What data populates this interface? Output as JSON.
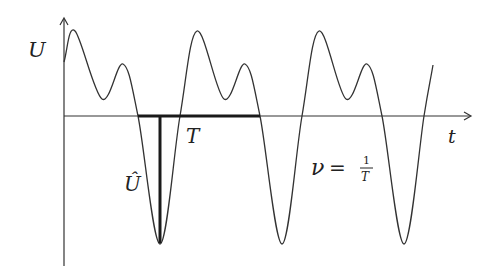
{
  "diagram": {
    "y_axis_label": "U",
    "x_axis_label": "t",
    "period_label": "T",
    "amplitude_label": "Û",
    "frequency_formula": {
      "lhs": "ν",
      "equals": "=",
      "numerator": "1",
      "denominator": "T"
    },
    "colors": {
      "curve": "#333333",
      "axes": "#333333",
      "markers": "#1a1a1a"
    }
  }
}
